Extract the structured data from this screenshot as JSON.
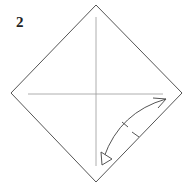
{
  "diagram": {
    "step_number": "2",
    "colors": {
      "outline": "#555555",
      "crease": "#999999",
      "arrow": "#555555",
      "background": "#ffffff"
    }
  }
}
